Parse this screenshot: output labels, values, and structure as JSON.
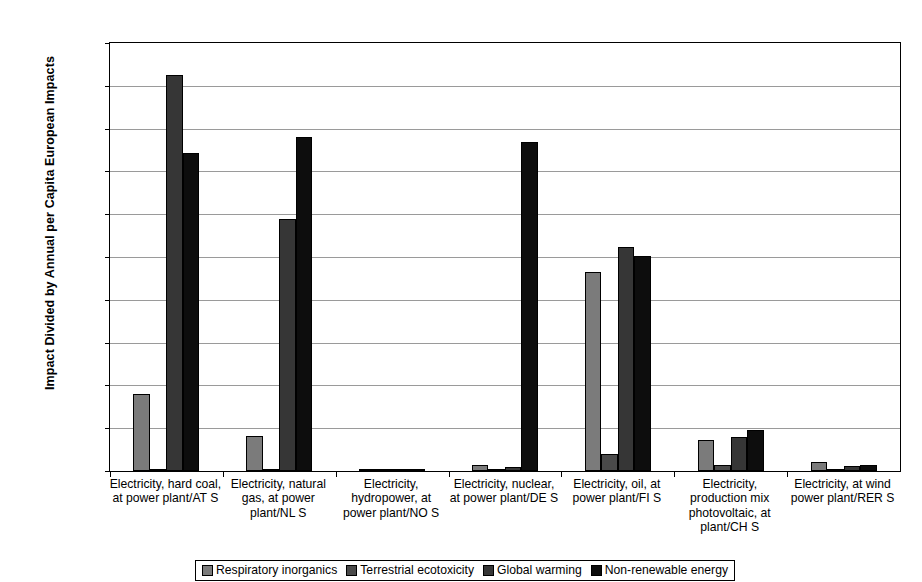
{
  "chart_data": {
    "type": "bar",
    "title": "",
    "xlabel": "",
    "ylabel": "Impact Divided by Annual per Capita European Impacts",
    "ylim": [
      0,
      0.0001
    ],
    "yticks": [
      "0",
      "0.00001",
      "0.00002",
      "0.00003",
      "0.00004",
      "0.00005",
      "0.00006",
      "0.00007",
      "0.00008",
      "0.00009",
      "0.0001"
    ],
    "grid": true,
    "legend_position": "bottom",
    "categories": [
      "Electricity, hard coal, at power plant/AT S",
      "Electricity, natural gas, at power plant/NL S",
      "Electricity, hydropower, at power plant/NO S",
      "Electricity, nuclear, at power plant/DE S",
      "Electricity, oil, at power plant/FI S",
      "Electricity, production mix photovoltaic, at plant/CH S",
      "Electricity, at wind power plant/RER S"
    ],
    "series": [
      {
        "name": "Respiratory inorganics",
        "color": "#7b7b7b",
        "values": [
          1.8e-05,
          8.2e-06,
          4e-07,
          1.3e-06,
          4.66e-05,
          7.3e-06,
          2.1e-06
        ]
      },
      {
        "name": "Terrestrial ecotoxicity",
        "color": "#4a4a4a",
        "values": [
          3e-07,
          2e-07,
          1e-07,
          1e-07,
          4e-06,
          1.5e-06,
          2e-07
        ]
      },
      {
        "name": "Global warming",
        "color": "#363636",
        "values": [
          9.25e-05,
          5.88e-05,
          5e-07,
          1e-06,
          5.23e-05,
          8e-06,
          1.2e-06
        ]
      },
      {
        "name": "Non-renewable energy",
        "color": "#0d0d0d",
        "values": [
          7.42e-05,
          7.8e-05,
          5e-07,
          7.68e-05,
          5.03e-05,
          9.6e-06,
          1.3e-06
        ]
      }
    ]
  },
  "axis": {
    "y_title": "Impact Divided by Annual per Capita European Impacts"
  }
}
